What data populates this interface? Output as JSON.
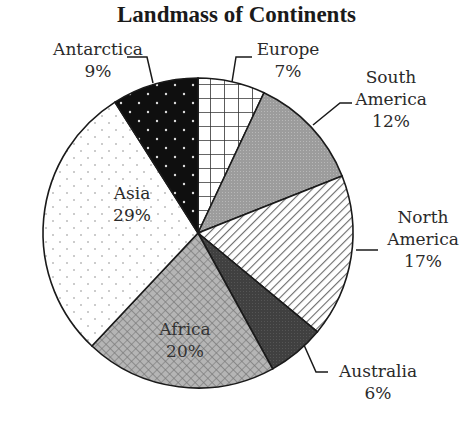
{
  "chart_data": {
    "type": "pie",
    "title": "Landmass of Continents",
    "categories": [
      "Europe",
      "South America",
      "North America",
      "Australia",
      "Africa",
      "Asia",
      "Antarctica"
    ],
    "values": [
      7,
      12,
      17,
      6,
      20,
      29,
      9
    ],
    "unit": "%",
    "labels": [
      {
        "name": "Europe",
        "pct": "7%"
      },
      {
        "name": "South America",
        "pct": "12%"
      },
      {
        "name": "North America",
        "pct": "17%"
      },
      {
        "name": "Australia",
        "pct": "6%"
      },
      {
        "name": "Africa",
        "pct": "20%"
      },
      {
        "name": "Asia",
        "pct": "29%"
      },
      {
        "name": "Antarctica",
        "pct": "9%"
      }
    ],
    "start_angle_deg": 0,
    "direction": "clockwise",
    "legend": "none (callout labels)"
  },
  "labels": {
    "europe": {
      "line1": "Europe",
      "pct": "7%"
    },
    "south_america": {
      "line1": "South",
      "line2": "America",
      "pct": "12%"
    },
    "north_america": {
      "line1": "North",
      "line2": "America",
      "pct": "17%"
    },
    "australia": {
      "line1": "Australia",
      "pct": "6%"
    },
    "africa": {
      "line1": "Africa",
      "pct": "20%"
    },
    "asia": {
      "line1": "Asia",
      "pct": "29%"
    },
    "antarctica": {
      "line1": "Antarctica",
      "pct": "9%"
    }
  }
}
